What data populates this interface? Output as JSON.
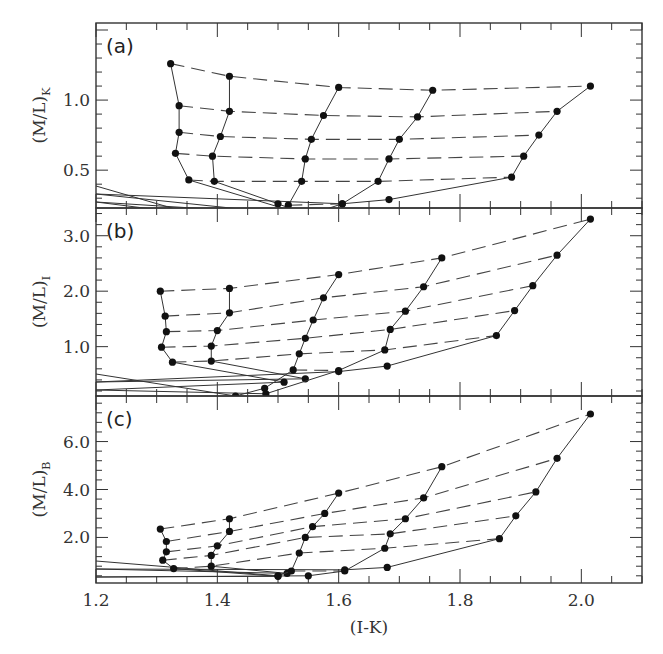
{
  "chart_data": {
    "type": "line",
    "xlabel": "(I-K)",
    "xlim": [
      1.2,
      2.1
    ],
    "xticks": [
      "1.2",
      "1.4",
      "1.6",
      "1.8",
      "2.0"
    ],
    "panels": [
      {
        "label": "(a)",
        "ylabel": "(M/L)",
        "ylabel_sub": "K",
        "ylim": [
          0.23,
          1.55
        ],
        "yticks": [
          {
            "v": 0.5,
            "t": "0.5"
          },
          {
            "v": 1.0,
            "t": "1.0"
          }
        ],
        "tracks": [
          [
            [
              1.323,
              1.26
            ],
            [
              1.337,
              0.96
            ],
            [
              1.337,
              0.77
            ],
            [
              1.331,
              0.62
            ],
            [
              1.353,
              0.43
            ],
            [
              1.545,
              0.18
            ]
          ],
          [
            [
              1.42,
              1.17
            ],
            [
              1.42,
              0.92
            ],
            [
              1.405,
              0.74
            ],
            [
              1.392,
              0.6
            ],
            [
              1.395,
              0.42
            ],
            [
              1.5,
              0.26
            ],
            [
              1.555,
              0.17
            ]
          ],
          [
            [
              1.6,
              1.09
            ],
            [
              1.575,
              0.89
            ],
            [
              1.555,
              0.72
            ],
            [
              1.545,
              0.58
            ],
            [
              1.539,
              0.42
            ],
            [
              1.517,
              0.25
            ],
            [
              1.49,
              0.16
            ],
            [
              1.46,
              0.06
            ]
          ],
          [
            [
              1.755,
              1.07
            ],
            [
              1.73,
              0.88
            ],
            [
              1.7,
              0.72
            ],
            [
              1.683,
              0.58
            ],
            [
              1.665,
              0.42
            ],
            [
              1.606,
              0.26
            ],
            [
              1.5,
              0.11
            ]
          ],
          [
            [
              2.015,
              1.1
            ],
            [
              1.96,
              0.92
            ],
            [
              1.93,
              0.75
            ],
            [
              1.905,
              0.6
            ],
            [
              1.885,
              0.45
            ],
            [
              1.683,
              0.29
            ],
            [
              1.606,
              0.26
            ]
          ]
        ],
        "isochrones": [
          [
            [
              1.323,
              1.26
            ],
            [
              1.42,
              1.17
            ],
            [
              1.6,
              1.09
            ],
            [
              1.755,
              1.07
            ],
            [
              2.015,
              1.1
            ]
          ],
          [
            [
              1.337,
              0.96
            ],
            [
              1.42,
              0.92
            ],
            [
              1.575,
              0.89
            ],
            [
              1.73,
              0.88
            ],
            [
              1.96,
              0.92
            ]
          ],
          [
            [
              1.337,
              0.77
            ],
            [
              1.405,
              0.74
            ],
            [
              1.555,
              0.72
            ],
            [
              1.7,
              0.72
            ],
            [
              1.93,
              0.75
            ]
          ],
          [
            [
              1.331,
              0.62
            ],
            [
              1.392,
              0.6
            ],
            [
              1.545,
              0.58
            ],
            [
              1.683,
              0.58
            ],
            [
              1.905,
              0.6
            ]
          ],
          [
            [
              1.353,
              0.43
            ],
            [
              1.395,
              0.42
            ],
            [
              1.539,
              0.42
            ],
            [
              1.665,
              0.42
            ],
            [
              1.885,
              0.45
            ]
          ],
          [
            [
              1.517,
              0.25
            ],
            [
              1.606,
              0.26
            ]
          ]
        ]
      },
      {
        "label": "(b)",
        "ylabel": "(M/L)",
        "ylabel_sub": "I",
        "ylim": [
          0.11,
          3.5
        ],
        "yticks": [
          {
            "v": 1.0,
            "t": "1.0"
          },
          {
            "v": 2.0,
            "t": "2.0"
          },
          {
            "v": 3.0,
            "t": "3.0"
          }
        ],
        "tracks": [
          [
            [
              1.306,
              2.0
            ],
            [
              1.314,
              1.55
            ],
            [
              1.316,
              1.27
            ],
            [
              1.308,
              0.99
            ],
            [
              1.326,
              0.72
            ],
            [
              1.51,
              0.36
            ]
          ],
          [
            [
              1.42,
              2.05
            ],
            [
              1.42,
              1.61
            ],
            [
              1.4,
              1.29
            ],
            [
              1.39,
              1.01
            ],
            [
              1.39,
              0.74
            ],
            [
              1.545,
              0.42
            ]
          ],
          [
            [
              1.6,
              2.3
            ],
            [
              1.575,
              1.88
            ],
            [
              1.558,
              1.48
            ],
            [
              1.545,
              1.15
            ],
            [
              1.535,
              0.87
            ],
            [
              1.525,
              0.58
            ],
            [
              1.478,
              0.25
            ],
            [
              1.43,
              0.11
            ]
          ],
          [
            [
              1.77,
              2.6
            ],
            [
              1.74,
              2.08
            ],
            [
              1.71,
              1.64
            ],
            [
              1.685,
              1.31
            ],
            [
              1.676,
              0.94
            ],
            [
              1.6,
              0.57
            ],
            [
              1.48,
              0.15
            ]
          ],
          [
            [
              2.015,
              3.3
            ],
            [
              1.96,
              2.65
            ],
            [
              1.92,
              2.1
            ],
            [
              1.89,
              1.65
            ],
            [
              1.86,
              1.2
            ],
            [
              1.68,
              0.65
            ],
            [
              1.6,
              0.55
            ]
          ]
        ],
        "isochrones": [
          [
            [
              1.306,
              2.0
            ],
            [
              1.42,
              2.05
            ],
            [
              1.6,
              2.3
            ],
            [
              1.77,
              2.6
            ],
            [
              2.015,
              3.3
            ]
          ],
          [
            [
              1.314,
              1.55
            ],
            [
              1.42,
              1.61
            ],
            [
              1.575,
              1.88
            ],
            [
              1.74,
              2.08
            ],
            [
              1.96,
              2.65
            ]
          ],
          [
            [
              1.316,
              1.27
            ],
            [
              1.4,
              1.29
            ],
            [
              1.558,
              1.48
            ],
            [
              1.71,
              1.64
            ],
            [
              1.92,
              2.1
            ]
          ],
          [
            [
              1.308,
              0.99
            ],
            [
              1.39,
              1.01
            ],
            [
              1.545,
              1.15
            ],
            [
              1.685,
              1.31
            ],
            [
              1.89,
              1.65
            ]
          ],
          [
            [
              1.326,
              0.72
            ],
            [
              1.39,
              0.74
            ],
            [
              1.535,
              0.87
            ],
            [
              1.676,
              0.94
            ],
            [
              1.86,
              1.2
            ]
          ],
          [
            [
              1.525,
              0.58
            ],
            [
              1.6,
              0.57
            ]
          ]
        ]
      },
      {
        "label": "(c)",
        "ylabel": "(M/L)",
        "ylabel_sub": "B",
        "ylim": [
          0.1,
          7.9
        ],
        "yticks": [
          {
            "v": 2.0,
            "t": "2.0"
          },
          {
            "v": 4.0,
            "t": "4.0"
          },
          {
            "v": 6.0,
            "t": "6.0"
          }
        ],
        "tracks": [
          [
            [
              1.306,
              2.35
            ],
            [
              1.316,
              1.83
            ],
            [
              1.316,
              1.4
            ],
            [
              1.31,
              1.05
            ],
            [
              1.328,
              0.7
            ],
            [
              1.5,
              0.38
            ]
          ],
          [
            [
              1.42,
              2.78
            ],
            [
              1.42,
              2.25
            ],
            [
              1.4,
              1.65
            ],
            [
              1.39,
              1.25
            ],
            [
              1.39,
              0.8
            ],
            [
              1.515,
              0.5
            ]
          ],
          [
            [
              1.6,
              3.85
            ],
            [
              1.577,
              3.0
            ],
            [
              1.557,
              2.45
            ],
            [
              1.545,
              2.0
            ],
            [
              1.535,
              1.35
            ],
            [
              1.522,
              0.6
            ],
            [
              1.5,
              0.4
            ]
          ],
          [
            [
              1.77,
              4.95
            ],
            [
              1.74,
              3.65
            ],
            [
              1.71,
              2.78
            ],
            [
              1.685,
              2.15
            ],
            [
              1.676,
              1.55
            ],
            [
              1.61,
              0.6
            ],
            [
              1.55,
              0.4
            ]
          ],
          [
            [
              2.015,
              7.15
            ],
            [
              1.96,
              5.3
            ],
            [
              1.925,
              3.9
            ],
            [
              1.892,
              2.9
            ],
            [
              1.865,
              1.95
            ],
            [
              1.68,
              0.75
            ],
            [
              1.61,
              0.65
            ]
          ]
        ],
        "isochrones": [
          [
            [
              1.306,
              2.35
            ],
            [
              1.42,
              2.78
            ],
            [
              1.6,
              3.85
            ],
            [
              1.77,
              4.95
            ],
            [
              2.015,
              7.15
            ]
          ],
          [
            [
              1.316,
              1.83
            ],
            [
              1.42,
              2.25
            ],
            [
              1.577,
              3.0
            ],
            [
              1.74,
              3.65
            ],
            [
              1.96,
              5.3
            ]
          ],
          [
            [
              1.316,
              1.4
            ],
            [
              1.4,
              1.65
            ],
            [
              1.557,
              2.45
            ],
            [
              1.71,
              2.78
            ],
            [
              1.925,
              3.9
            ]
          ],
          [
            [
              1.31,
              1.05
            ],
            [
              1.39,
              1.25
            ],
            [
              1.545,
              2.0
            ],
            [
              1.685,
              2.15
            ],
            [
              1.892,
              2.9
            ]
          ],
          [
            [
              1.328,
              0.7
            ],
            [
              1.39,
              0.8
            ],
            [
              1.535,
              1.35
            ],
            [
              1.676,
              1.55
            ],
            [
              1.865,
              1.95
            ]
          ],
          [
            [
              1.522,
              0.6
            ],
            [
              1.61,
              0.6
            ]
          ]
        ]
      }
    ],
    "extra_lines_note": "near-horizontal solid lines entering from left edge at bottom of each panel"
  }
}
